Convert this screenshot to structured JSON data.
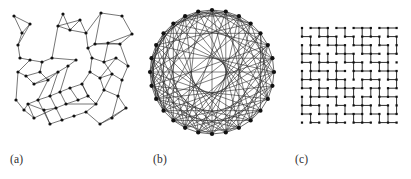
{
  "figure": {
    "type": "multi-panel-network-diagram",
    "background_color": "#ffffff",
    "ink_color": "#1a1a1a",
    "panel_count": 3
  },
  "panels": [
    {
      "id": "a",
      "label": "(a)",
      "kind": "spatial-geometric-network",
      "node_color": "#111111",
      "edge_color": "#2b2b2b"
    },
    {
      "id": "b",
      "label": "(b)",
      "kind": "circular-random-graph",
      "node_color": "#111111",
      "edge_color": "#2b2b2b"
    },
    {
      "id": "c",
      "label": "(c)",
      "kind": "square-lattice-bond-percolation",
      "node_color": "#111111",
      "edge_color": "#2b2b2b"
    }
  ],
  "chart_data": [
    {
      "type": "scatter",
      "id": "a",
      "title": "(a)",
      "description": "Spatial geometric network with clustered communities",
      "xlabel": "",
      "ylabel": "",
      "xlim": [
        0,
        140
      ],
      "ylim": [
        0,
        145
      ],
      "grid": false,
      "legend": "none",
      "nodes": [
        [
          14,
          16
        ],
        [
          30,
          24
        ],
        [
          22,
          33
        ],
        [
          18,
          45
        ],
        [
          20,
          58
        ],
        [
          63,
          14
        ],
        [
          58,
          26
        ],
        [
          70,
          30
        ],
        [
          80,
          20
        ],
        [
          86,
          33
        ],
        [
          101,
          13
        ],
        [
          122,
          16
        ],
        [
          132,
          34
        ],
        [
          120,
          44
        ],
        [
          108,
          43
        ],
        [
          95,
          44
        ],
        [
          88,
          48
        ],
        [
          30,
          60
        ],
        [
          42,
          62
        ],
        [
          52,
          58
        ],
        [
          40,
          72
        ],
        [
          26,
          76
        ],
        [
          18,
          72
        ],
        [
          34,
          84
        ],
        [
          48,
          80
        ],
        [
          58,
          72
        ],
        [
          68,
          66
        ],
        [
          76,
          60
        ],
        [
          92,
          58
        ],
        [
          104,
          62
        ],
        [
          116,
          58
        ],
        [
          128,
          66
        ],
        [
          122,
          80
        ],
        [
          112,
          74
        ],
        [
          100,
          78
        ],
        [
          90,
          72
        ],
        [
          82,
          84
        ],
        [
          70,
          88
        ],
        [
          60,
          92
        ],
        [
          50,
          96
        ],
        [
          38,
          100
        ],
        [
          28,
          104
        ],
        [
          44,
          110
        ],
        [
          56,
          108
        ],
        [
          66,
          104
        ],
        [
          78,
          100
        ],
        [
          88,
          96
        ],
        [
          96,
          104
        ],
        [
          86,
          112
        ],
        [
          74,
          116
        ],
        [
          62,
          120
        ],
        [
          50,
          124
        ],
        [
          104,
          90
        ],
        [
          118,
          96
        ],
        [
          126,
          108
        ],
        [
          112,
          118
        ],
        [
          100,
          124
        ],
        [
          34,
          118
        ],
        [
          24,
          110
        ],
        [
          16,
          100
        ]
      ],
      "edges": [
        [
          0,
          1
        ],
        [
          1,
          2
        ],
        [
          2,
          3
        ],
        [
          3,
          4
        ],
        [
          0,
          2
        ],
        [
          1,
          3
        ],
        [
          5,
          6
        ],
        [
          6,
          7
        ],
        [
          7,
          8
        ],
        [
          8,
          9
        ],
        [
          5,
          7
        ],
        [
          6,
          8
        ],
        [
          7,
          9
        ],
        [
          10,
          11
        ],
        [
          11,
          12
        ],
        [
          12,
          13
        ],
        [
          13,
          14
        ],
        [
          14,
          15
        ],
        [
          15,
          16
        ],
        [
          10,
          15
        ],
        [
          9,
          16
        ],
        [
          9,
          10
        ],
        [
          12,
          14
        ],
        [
          13,
          15
        ],
        [
          4,
          17
        ],
        [
          17,
          18
        ],
        [
          18,
          19
        ],
        [
          19,
          6
        ],
        [
          17,
          22
        ],
        [
          22,
          21
        ],
        [
          21,
          20
        ],
        [
          20,
          18
        ],
        [
          21,
          23
        ],
        [
          23,
          24
        ],
        [
          24,
          25
        ],
        [
          25,
          26
        ],
        [
          26,
          27
        ],
        [
          27,
          19
        ],
        [
          20,
          24
        ],
        [
          23,
          25
        ],
        [
          16,
          28
        ],
        [
          28,
          29
        ],
        [
          29,
          30
        ],
        [
          30,
          31
        ],
        [
          31,
          32
        ],
        [
          32,
          33
        ],
        [
          33,
          34
        ],
        [
          34,
          35
        ],
        [
          35,
          28
        ],
        [
          29,
          33
        ],
        [
          30,
          34
        ],
        [
          14,
          29
        ],
        [
          13,
          31
        ],
        [
          35,
          36
        ],
        [
          36,
          37
        ],
        [
          37,
          38
        ],
        [
          38,
          39
        ],
        [
          39,
          40
        ],
        [
          40,
          41
        ],
        [
          41,
          42
        ],
        [
          42,
          43
        ],
        [
          43,
          44
        ],
        [
          44,
          45
        ],
        [
          45,
          46
        ],
        [
          46,
          36
        ],
        [
          26,
          38
        ],
        [
          25,
          39
        ],
        [
          24,
          40
        ],
        [
          37,
          45
        ],
        [
          38,
          44
        ],
        [
          46,
          47
        ],
        [
          47,
          48
        ],
        [
          48,
          49
        ],
        [
          49,
          50
        ],
        [
          50,
          51
        ],
        [
          51,
          42
        ],
        [
          47,
          52
        ],
        [
          52,
          53
        ],
        [
          53,
          54
        ],
        [
          54,
          55
        ],
        [
          55,
          56
        ],
        [
          56,
          48
        ],
        [
          52,
          34
        ],
        [
          33,
          52
        ],
        [
          53,
          55
        ],
        [
          41,
          57
        ],
        [
          57,
          58
        ],
        [
          58,
          59
        ],
        [
          59,
          22
        ],
        [
          57,
          43
        ],
        [
          58,
          41
        ],
        [
          39,
          50
        ],
        [
          40,
          51
        ],
        [
          36,
          46
        ],
        [
          44,
          47
        ],
        [
          32,
          53
        ],
        [
          54,
          56
        ]
      ]
    },
    {
      "type": "scatter",
      "id": "b",
      "title": "(b)",
      "description": "Dense random graph with nodes arranged on a circle",
      "xlabel": "",
      "ylabel": "",
      "xlim": [
        0,
        145
      ],
      "ylim": [
        0,
        145
      ],
      "grid": false,
      "legend": "none",
      "layout": "circular",
      "node_count": 28,
      "circle_center": [
        72,
        72
      ],
      "circle_radius": 62,
      "edge_count": 112,
      "edges_by_index": [
        [
          0,
          5
        ],
        [
          0,
          9
        ],
        [
          0,
          14
        ],
        [
          0,
          18
        ],
        [
          0,
          22
        ],
        [
          0,
          3
        ],
        [
          1,
          6
        ],
        [
          1,
          11
        ],
        [
          1,
          16
        ],
        [
          1,
          20
        ],
        [
          1,
          25
        ],
        [
          1,
          4
        ],
        [
          2,
          7
        ],
        [
          2,
          12
        ],
        [
          2,
          17
        ],
        [
          2,
          21
        ],
        [
          2,
          26
        ],
        [
          2,
          9
        ],
        [
          3,
          8
        ],
        [
          3,
          13
        ],
        [
          3,
          19
        ],
        [
          3,
          23
        ],
        [
          3,
          27
        ],
        [
          4,
          10
        ],
        [
          4,
          15
        ],
        [
          4,
          18
        ],
        [
          4,
          24
        ],
        [
          4,
          9
        ],
        [
          5,
          11
        ],
        [
          5,
          16
        ],
        [
          5,
          20
        ],
        [
          5,
          25
        ],
        [
          5,
          13
        ],
        [
          6,
          12
        ],
        [
          6,
          17
        ],
        [
          6,
          22
        ],
        [
          6,
          26
        ],
        [
          6,
          14
        ],
        [
          7,
          13
        ],
        [
          7,
          18
        ],
        [
          7,
          23
        ],
        [
          7,
          27
        ],
        [
          7,
          15
        ],
        [
          8,
          14
        ],
        [
          8,
          19
        ],
        [
          8,
          24
        ],
        [
          8,
          16
        ],
        [
          8,
          11
        ],
        [
          9,
          15
        ],
        [
          9,
          20
        ],
        [
          9,
          25
        ],
        [
          9,
          17
        ],
        [
          10,
          16
        ],
        [
          10,
          21
        ],
        [
          10,
          26
        ],
        [
          10,
          18
        ],
        [
          10,
          13
        ],
        [
          11,
          17
        ],
        [
          11,
          22
        ],
        [
          11,
          27
        ],
        [
          11,
          19
        ],
        [
          12,
          18
        ],
        [
          12,
          23
        ],
        [
          12,
          20
        ],
        [
          12,
          15
        ],
        [
          13,
          19
        ],
        [
          13,
          24
        ],
        [
          13,
          21
        ],
        [
          14,
          20
        ],
        [
          14,
          25
        ],
        [
          14,
          22
        ],
        [
          14,
          17
        ],
        [
          15,
          21
        ],
        [
          15,
          26
        ],
        [
          15,
          23
        ],
        [
          16,
          22
        ],
        [
          16,
          27
        ],
        [
          16,
          24
        ],
        [
          16,
          19
        ],
        [
          17,
          23
        ],
        [
          17,
          25
        ],
        [
          17,
          20
        ],
        [
          18,
          24
        ],
        [
          18,
          26
        ],
        [
          18,
          21
        ],
        [
          19,
          25
        ],
        [
          19,
          27
        ],
        [
          19,
          22
        ],
        [
          20,
          26
        ],
        [
          20,
          23
        ],
        [
          21,
          27
        ],
        [
          21,
          24
        ],
        [
          21,
          18
        ],
        [
          22,
          25
        ],
        [
          22,
          19
        ],
        [
          23,
          26
        ],
        [
          23,
          20
        ],
        [
          24,
          27
        ],
        [
          24,
          21
        ],
        [
          25,
          22
        ],
        [
          25,
          0
        ],
        [
          26,
          1
        ],
        [
          26,
          23
        ],
        [
          27,
          2
        ],
        [
          27,
          24
        ],
        [
          0,
          12
        ],
        [
          1,
          13
        ],
        [
          2,
          14
        ],
        [
          3,
          15
        ],
        [
          4,
          16
        ],
        [
          5,
          17
        ],
        [
          6,
          19
        ],
        [
          7,
          21
        ]
      ]
    },
    {
      "type": "scatter",
      "id": "c",
      "title": "(c)",
      "description": "Square lattice with a fraction of bonds removed (bond percolation)",
      "xlabel": "",
      "ylabel": "",
      "xlim": [
        0,
        126
      ],
      "ylim": [
        0,
        145
      ],
      "grid": false,
      "legend": "none",
      "layout": "square-lattice",
      "rows": 12,
      "cols": 12,
      "spacing": 8.6,
      "origin": [
        17,
        28
      ],
      "horizontal_bonds": [
        "011010110110",
        "101101011011",
        "010110110101",
        "110011011010",
        "101101101101",
        "011010110110",
        "110110011011",
        "101011101010",
        "011101010111",
        "110010110101",
        "101101101011",
        "010110110110"
      ],
      "vertical_bonds": [
        "101101011010",
        "010110110101",
        "110011011011",
        "101101101010",
        "011010110110",
        "110110101011",
        "101011010101",
        "011101101110",
        "110010110101",
        "101101011011",
        "010110110110"
      ]
    }
  ]
}
